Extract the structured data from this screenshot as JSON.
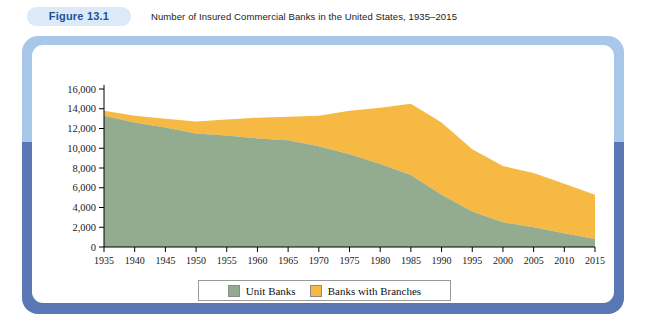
{
  "header": {
    "figure_badge": "Figure 13.1",
    "title": "Number of Insured Commercial Banks in the United States, 1935–2015"
  },
  "colors": {
    "unit_banks": "#93ab8e",
    "banks_with_branches": "#f5b944",
    "frame_top": "#a9c7e8",
    "frame_bottom": "#5877b4",
    "badge_bg": "#dceaf7",
    "badge_text": "#1f4e9c",
    "axis": "#000000"
  },
  "legend": {
    "items": [
      {
        "label": "Unit Banks",
        "color": "#93ab8e"
      },
      {
        "label": "Banks with Branches",
        "color": "#f5b944"
      }
    ]
  },
  "chart_data": {
    "type": "area",
    "stacked": true,
    "title": "Number of Insured Commercial Banks in the United States, 1935–2015",
    "xlabel": "",
    "ylabel": "",
    "grid": false,
    "legend_position": "bottom",
    "xlim": [
      1935,
      2015
    ],
    "ylim": [
      0,
      16000
    ],
    "ytick_labels": [
      "16,000",
      "14,000",
      "12,000",
      "10,000",
      "8,000",
      "6,000",
      "4,000",
      "2,000",
      "0"
    ],
    "yticks": [
      16000,
      14000,
      12000,
      10000,
      8000,
      6000,
      4000,
      2000,
      0
    ],
    "xtick_labels": [
      "1935",
      "1940",
      "1945",
      "1950",
      "1955",
      "1960",
      "1965",
      "1970",
      "1975",
      "1980",
      "1985",
      "1990",
      "1995",
      "2000",
      "2005",
      "2010",
      "2015"
    ],
    "x": [
      1935,
      1940,
      1945,
      1950,
      1955,
      1960,
      1965,
      1970,
      1975,
      1980,
      1985,
      1990,
      1995,
      2000,
      2005,
      2010,
      2015
    ],
    "series": [
      {
        "name": "Unit Banks",
        "color": "#93ab8e",
        "values": [
          13300,
          12600,
          12100,
          11500,
          11300,
          11000,
          10800,
          10200,
          9400,
          8400,
          7300,
          5300,
          3600,
          2500,
          2000,
          1400,
          800
        ]
      },
      {
        "name": "Banks with Branches",
        "color": "#f5b944",
        "values": [
          500,
          700,
          900,
          1200,
          1600,
          2100,
          2400,
          3100,
          4400,
          5700,
          7200,
          7300,
          6300,
          5700,
          5500,
          5000,
          4500
        ]
      }
    ],
    "totals": [
      13800,
      13300,
      13000,
      12700,
      12900,
      13100,
      13200,
      13300,
      13800,
      14100,
      14500,
      12600,
      9900,
      8200,
      7500,
      6400,
      5300
    ]
  }
}
